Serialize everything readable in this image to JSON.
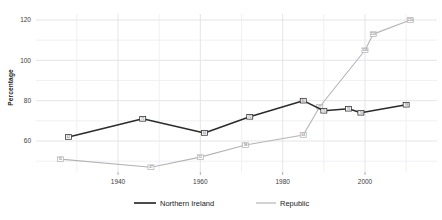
{
  "chart_data": {
    "type": "line",
    "title": "",
    "xlabel": "",
    "ylabel": "Percentage",
    "xlim": [
      1922,
      2015
    ],
    "ylim": [
      44,
      124
    ],
    "xticks": [
      1940,
      1960,
      1980,
      2000
    ],
    "yticks": [
      60,
      80,
      100,
      120
    ],
    "xtick_labels": [
      "1940",
      "1960",
      "1980",
      "2000"
    ],
    "ytick_labels": [
      "60",
      "80",
      "100",
      "120"
    ],
    "grid": true,
    "legend_position": "bottom",
    "point_labels": true,
    "series": [
      {
        "name": "Northern Ireland",
        "color": "#2b2b2b",
        "marker": "square",
        "x": [
          1928,
          1946,
          1961,
          1972,
          1985,
          1990,
          1996,
          1999,
          2010
        ],
        "values": [
          62,
          71,
          64,
          72,
          80,
          75,
          76,
          74,
          78
        ]
      },
      {
        "name": "Republic",
        "color": "#b4b4b4",
        "marker": "square",
        "x": [
          1926,
          1948,
          1960,
          1971,
          1985,
          1989,
          2000,
          2002,
          2011
        ],
        "values": [
          51,
          47,
          52,
          58,
          63,
          77,
          105,
          113,
          120
        ]
      }
    ],
    "legend": [
      {
        "label": "Northern Ireland",
        "color": "#2b2b2b"
      },
      {
        "label": "Republic",
        "color": "#b4b4b4"
      }
    ],
    "colors": {
      "northern_ireland": "#2b2b2b",
      "republic": "#b4b4b4",
      "grid": "#e2e2e6",
      "axis_text": "#3c3c3c",
      "background": "#ffffff"
    }
  }
}
